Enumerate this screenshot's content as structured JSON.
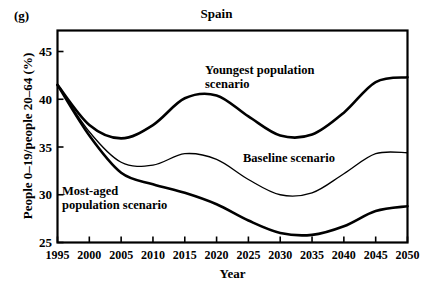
{
  "panel": {
    "label": "(g)"
  },
  "chart_data": {
    "type": "line",
    "title": "Spain",
    "xlabel": "Year",
    "ylabel": "People 0–19/people 20–64 (%)",
    "xlim": [
      1995,
      2050
    ],
    "ylim": [
      25,
      47.2
    ],
    "grid": false,
    "legend_position": "inline-annotations",
    "xticks": [
      1995,
      2000,
      2005,
      2010,
      2015,
      2020,
      2025,
      2030,
      2035,
      2040,
      2045,
      2050
    ],
    "xtick_labels": [
      "1995",
      "2000",
      "2005",
      "2010",
      "2015",
      "2020",
      "2025",
      "2030",
      "2035",
      "2040",
      "2045",
      "2050"
    ],
    "yticks": [
      25,
      30,
      35,
      40,
      45
    ],
    "ytick_labels": [
      "25",
      "30",
      "35",
      "40",
      "45"
    ],
    "x": [
      1995,
      2000,
      2005,
      2010,
      2015,
      2020,
      2025,
      2030,
      2035,
      2040,
      2045,
      2050
    ],
    "series": [
      {
        "name": "Youngest population scenario",
        "annotation": "Youngest population\nscenario",
        "color": "#000000",
        "line_width": 2.6,
        "values": [
          41.5,
          37.3,
          35.9,
          37.3,
          40.1,
          40.4,
          38.2,
          36.2,
          36.3,
          38.6,
          41.8,
          42.3
        ]
      },
      {
        "name": "Baseline scenario",
        "annotation": "Baseline scenario",
        "color": "#000000",
        "line_width": 1.3,
        "values": [
          41.5,
          36.6,
          33.4,
          33.1,
          34.3,
          33.7,
          31.6,
          30.0,
          30.2,
          32.2,
          34.3,
          34.4
        ]
      },
      {
        "name": "Most-aged population scenario",
        "annotation": "Most-aged\npopulation scenario",
        "color": "#000000",
        "line_width": 2.6,
        "values": [
          41.5,
          36.2,
          32.3,
          31.1,
          30.2,
          29.0,
          27.3,
          26.0,
          25.8,
          26.7,
          28.3,
          28.8
        ]
      }
    ]
  }
}
